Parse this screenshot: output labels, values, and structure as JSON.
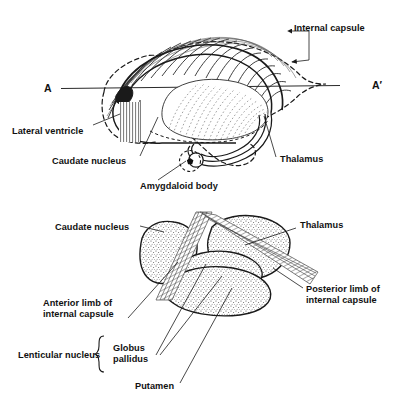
{
  "figure": {
    "background_color": "#ffffff",
    "ink_color": "#1a1a1a"
  },
  "upper_diagram": {
    "name": "lateral-view-internal-capsule",
    "section_line": {
      "left_label": "A",
      "right_label": "A′"
    },
    "labels": {
      "internal_capsule": "Internal capsule",
      "lateral_ventricle": "Lateral ventricle",
      "caudate_nucleus": "Caudate nucleus",
      "amygdaloid_body": "Amygdaloid body",
      "thalamus": "Thalamus"
    }
  },
  "lower_diagram": {
    "name": "horizontal-section-basal-nuclei",
    "labels": {
      "caudate_nucleus": "Caudate nucleus",
      "thalamus": "Thalamus",
      "posterior_limb_line1": "Posterior limb of",
      "posterior_limb_line2": "internal capsule",
      "anterior_limb_line1": "Anterior limb of",
      "anterior_limb_line2": "internal capsule",
      "lenticular_nucleus": "Lenticular nucleus",
      "globus_line1": "Globus",
      "globus_line2": "pallidus",
      "putamen": "Putamen"
    }
  },
  "colors": {
    "outline": "#1a1a1a",
    "stipple": "#4a4a4a",
    "hatch": "#3d3d3d",
    "text": "#111111"
  }
}
